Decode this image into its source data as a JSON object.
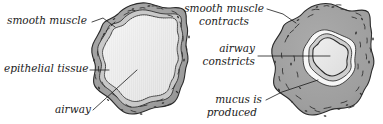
{
  "figure": {
    "background_color": "#ffffff",
    "panels": [
      {
        "id": "normal-airway",
        "name": "normal-airway-panel",
        "description": "Relaxed bronchiole with wide open lumen",
        "labels": [
          {
            "id": "smooth-muscle",
            "name": "label-smooth-muscle",
            "lines": [
              "smooth muscle"
            ],
            "anchor_x": 7,
            "anchor_y": 24,
            "align": "start"
          },
          {
            "id": "epithelial-tissue",
            "name": "label-epithelial-tissue",
            "lines": [
              "epithelial tissue"
            ],
            "anchor_x": 4,
            "anchor_y": 72,
            "align": "start"
          },
          {
            "id": "airway",
            "name": "label-airway",
            "lines": [
              "airway"
            ],
            "anchor_x": 55,
            "anchor_y": 113,
            "align": "start"
          }
        ]
      },
      {
        "id": "constricted-airway",
        "name": "constricted-airway-panel",
        "description": "Asthmatic bronchiole with contracted muscle, narrowed lumen and mucus",
        "labels": [
          {
            "id": "smooth-muscle-contracts",
            "name": "label-smooth-muscle-contracts",
            "lines": [
              "smooth muscle",
              "contracts"
            ],
            "anchor_x": 264,
            "anchor_y": 12,
            "align": "end"
          },
          {
            "id": "airway-constricts",
            "name": "label-airway-constricts",
            "lines": [
              "airway",
              "constricts"
            ],
            "anchor_x": 255,
            "anchor_y": 52,
            "align": "end"
          },
          {
            "id": "mucus-is-produced",
            "name": "label-mucus-is-produced",
            "lines": [
              "mucus is",
              "produced"
            ],
            "anchor_x": 262,
            "anchor_y": 103,
            "align": "end"
          }
        ]
      }
    ],
    "colors": {
      "smooth_muscle": "#a3a3a3",
      "smooth_muscle_shadow": "#8d8d8d",
      "epithelium": "#c9c9c9",
      "lumen": "#e6e6e6",
      "mucus": "#f7f7f7",
      "outline": "#2a2a2a",
      "text": "#1a1a1a",
      "background": "#ffffff"
    }
  }
}
